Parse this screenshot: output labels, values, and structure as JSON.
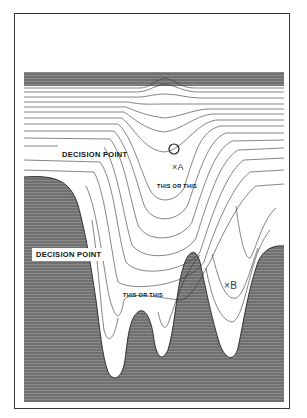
{
  "figure": {
    "labels": {
      "decision_point_upper": "DECISION POINT",
      "decision_point_lower": "DECISION POINT",
      "this_or_this_upper": "THIS OR THIS",
      "this_or_this_lower": "THIS OR THIS",
      "marker_a": "×A",
      "marker_b": "×B"
    },
    "colors": {
      "shade": "#6e6e6e",
      "contour": "#333333",
      "background": "#ffffff"
    }
  }
}
